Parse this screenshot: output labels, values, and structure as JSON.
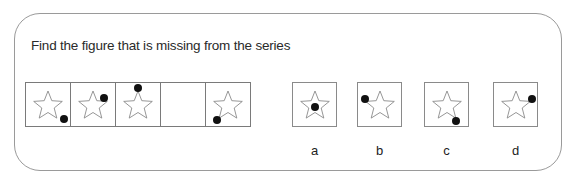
{
  "question": {
    "prompt": "Find the figure that is missing from the series"
  },
  "series": [
    {
      "index": 1,
      "dot": "bottom-right-tip",
      "dot_xy": [
        38,
        36
      ]
    },
    {
      "index": 2,
      "dot": "upper-right-arm",
      "dot_xy": [
        33,
        15
      ]
    },
    {
      "index": 3,
      "dot": "top-tip",
      "dot_xy": [
        22,
        5
      ]
    },
    {
      "index": 4,
      "dot": "missing",
      "dot_xy": null
    },
    {
      "index": 5,
      "dot": "bottom-left-tip",
      "dot_xy": [
        11,
        37
      ]
    }
  ],
  "options": [
    {
      "label": "a",
      "dot": "center",
      "dot_xy": [
        22,
        24
      ]
    },
    {
      "label": "b",
      "dot": "left-arm",
      "dot_xy": [
        7,
        16
      ]
    },
    {
      "label": "c",
      "dot": "bottom-right-tip",
      "dot_xy": [
        31,
        38
      ]
    },
    {
      "label": "d",
      "dot": "right-arm",
      "dot_xy": [
        38,
        16
      ]
    }
  ],
  "colors": {
    "star_stroke": "#8a8a8a",
    "dot": "#111111",
    "frame": "#9a9a9a"
  }
}
